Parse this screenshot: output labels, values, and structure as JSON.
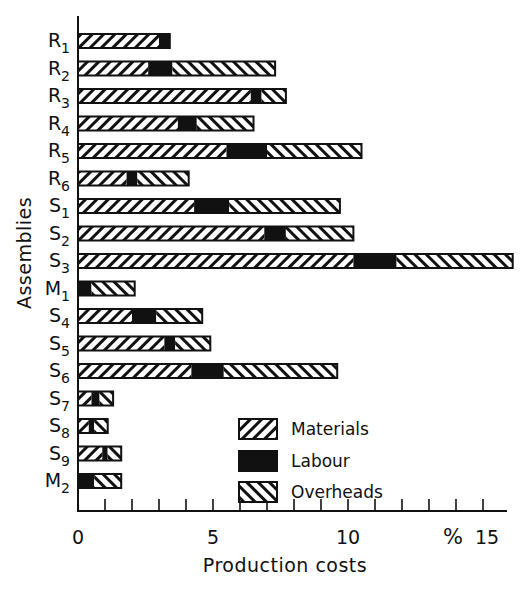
{
  "chart_data": {
    "type": "bar",
    "orientation": "horizontal",
    "stacked": true,
    "title": "",
    "xlabel": "Production costs",
    "ylabel": "Assemblies",
    "x_unit_label": "%",
    "xlim": [
      0,
      16
    ],
    "xticks": [
      0,
      1,
      2,
      3,
      4,
      5,
      6,
      7,
      8,
      9,
      10,
      11,
      12,
      13,
      14,
      15
    ],
    "xtick_labels": [
      {
        "value": 0,
        "label": "0"
      },
      {
        "value": 5,
        "label": "5"
      },
      {
        "value": 10,
        "label": "10"
      },
      {
        "value": 15,
        "label": "15"
      }
    ],
    "grid": false,
    "legend_position": "lower right (inside)",
    "categories": [
      {
        "base": "R",
        "sub": "1"
      },
      {
        "base": "R",
        "sub": "2"
      },
      {
        "base": "R",
        "sub": "3"
      },
      {
        "base": "R",
        "sub": "4"
      },
      {
        "base": "R",
        "sub": "5"
      },
      {
        "base": "R",
        "sub": "6"
      },
      {
        "base": "S",
        "sub": "1"
      },
      {
        "base": "S",
        "sub": "2"
      },
      {
        "base": "S",
        "sub": "3"
      },
      {
        "base": "M",
        "sub": "1"
      },
      {
        "base": "S",
        "sub": "4"
      },
      {
        "base": "S",
        "sub": "5"
      },
      {
        "base": "S",
        "sub": "6"
      },
      {
        "base": "S",
        "sub": "7"
      },
      {
        "base": "S",
        "sub": "8"
      },
      {
        "base": "S",
        "sub": "9"
      },
      {
        "base": "M",
        "sub": "2"
      }
    ],
    "category_names": [
      "R1",
      "R2",
      "R3",
      "R4",
      "R5",
      "R6",
      "S1",
      "S2",
      "S3",
      "M1",
      "S4",
      "S5",
      "S6",
      "S7",
      "S8",
      "S9",
      "M2"
    ],
    "series": [
      {
        "name": "Materials",
        "pattern": "hatch-forward",
        "values": [
          3.0,
          2.6,
          6.4,
          3.7,
          5.5,
          1.8,
          4.3,
          6.9,
          10.2,
          0.0,
          2.0,
          3.2,
          4.2,
          0.5,
          0.4,
          0.9,
          0.0
        ]
      },
      {
        "name": "Labour",
        "pattern": "solid-black",
        "values": [
          0.4,
          0.9,
          0.4,
          0.7,
          1.5,
          0.4,
          1.3,
          0.8,
          1.6,
          0.5,
          0.9,
          0.4,
          1.2,
          0.3,
          0.2,
          0.2,
          0.6
        ]
      },
      {
        "name": "Overheads",
        "pattern": "hatch-backward",
        "values": [
          0.0,
          3.8,
          0.9,
          2.1,
          3.5,
          1.9,
          4.1,
          2.5,
          4.3,
          1.6,
          1.7,
          1.3,
          4.2,
          0.5,
          0.5,
          0.5,
          1.0
        ]
      }
    ],
    "totals": [
      3.4,
      7.3,
      7.7,
      6.5,
      10.5,
      4.1,
      9.7,
      10.2,
      16.1,
      2.1,
      4.6,
      4.9,
      9.6,
      1.3,
      1.1,
      1.6,
      1.6
    ]
  },
  "legend": {
    "items": [
      {
        "label": "Materials",
        "pattern": "hatch-forward"
      },
      {
        "label": "Labour",
        "pattern": "solid-black"
      },
      {
        "label": "Overheads",
        "pattern": "hatch-backward"
      }
    ]
  },
  "colors": {
    "ink": "#111111",
    "background": "#ffffff"
  }
}
